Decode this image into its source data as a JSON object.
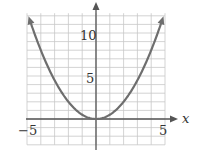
{
  "chart_data": {
    "type": "line",
    "title": "",
    "xlabel": "x",
    "ylabel": "",
    "xlim": [
      -5,
      5
    ],
    "ylim": [
      -3,
      12.5
    ],
    "grid": true,
    "x_ticks_labeled": [
      "-5",
      "5"
    ],
    "y_ticks_labeled": [
      "5",
      "10"
    ],
    "series": [
      {
        "name": "y = x^2 / 2",
        "color": "#6e6e6e",
        "x": [
          -5,
          -4,
          -3,
          -2,
          -1,
          0,
          1,
          2,
          3,
          4,
          5
        ],
        "values": [
          12.5,
          8,
          4.5,
          2,
          0.5,
          0,
          0.5,
          2,
          4.5,
          8,
          12.5
        ]
      }
    ]
  },
  "labels": {
    "xaxis": "x",
    "xmin": "−5",
    "xmax": "5",
    "y5": "5",
    "y10": "10"
  }
}
